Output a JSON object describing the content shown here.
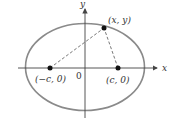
{
  "diagram": {
    "axes": {
      "x_label": "x",
      "y_label": "y",
      "origin_label": "0"
    },
    "points": {
      "left_focus": "(−c, 0)",
      "right_focus": "(c, 0)",
      "point_on_ellipse": "(x, y)"
    },
    "colors": {
      "ellipse": "#8a8a8a",
      "axes": "#444444",
      "points": "#111111",
      "dashed_lines": "#555555"
    }
  }
}
